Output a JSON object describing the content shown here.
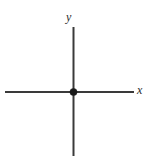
{
  "figure": {
    "type": "cartesian-axes-diagram",
    "width": 149,
    "height": 156,
    "background_color": "#ffffff",
    "stroke_color": "#3a3a3a",
    "point_color": "#1a1a1a",
    "labels": {
      "y_axis": "y",
      "x_axis": "x"
    },
    "geometry": {
      "origin": {
        "x": 73.5,
        "y": 92
      },
      "x_axis": {
        "x1": 5,
        "y1": 92,
        "x2": 134,
        "y2": 92,
        "stroke_width": 2
      },
      "y_axis": {
        "x1": 73.5,
        "y1": 27,
        "x2": 73.5,
        "y2": 156,
        "stroke_width": 2
      },
      "origin_point": {
        "cx": 73.5,
        "cy": 92,
        "r": 3.6
      }
    }
  },
  "chart_data": {
    "type": "scatter",
    "title": "",
    "subtitle": "",
    "xlabel": "x",
    "ylabel": "y",
    "x": [
      0
    ],
    "y": [
      0
    ],
    "point_labels": [
      "origin"
    ],
    "xlim": [
      -1,
      1
    ],
    "ylim": [
      -1,
      1
    ],
    "grid": false,
    "legend": null,
    "tick_labels": {
      "x": [],
      "y": []
    },
    "annotations": []
  }
}
